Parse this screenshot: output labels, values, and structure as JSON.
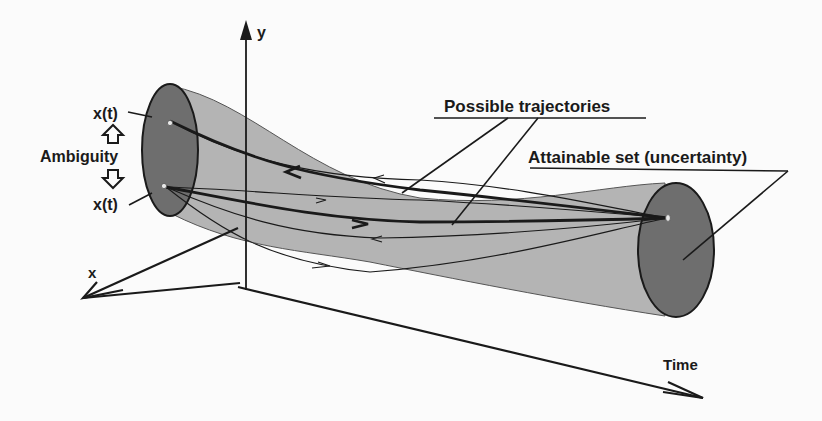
{
  "figure": {
    "axes": {
      "y_label": "y",
      "x_label": "x",
      "time_label": "Time"
    },
    "labels": {
      "possible_trajectories": "Possible trajectories",
      "attainable_set": "Attainable set (uncertainty)",
      "ambiguity": "Ambiguity",
      "state_top": "x(t)",
      "state_bottom": "x(t)"
    },
    "icons": {
      "ambiguity_up": "hollow-up-arrow",
      "ambiguity_down": "hollow-down-arrow"
    },
    "colors": {
      "background": "#fbfbfb",
      "tube_fill": "#b4b4b4",
      "ellipse_fill": "#6e6e6e",
      "line": "#1a1a1a",
      "point": "#e8e8e8"
    }
  }
}
